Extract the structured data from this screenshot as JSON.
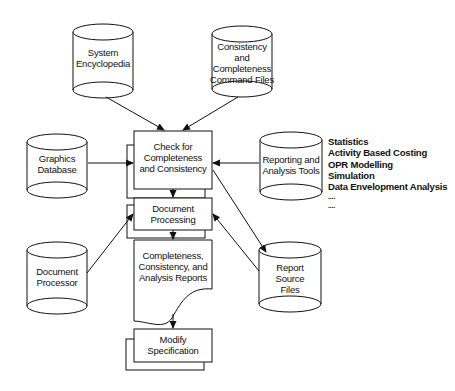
{
  "diagram": {
    "type": "flowchart",
    "nodes": {
      "system_encyclopedia": {
        "shape": "database",
        "label": "System Encyclopedia",
        "lines": [
          "System",
          "Encyclopedia"
        ]
      },
      "command_files": {
        "shape": "database",
        "label": "Consistency and Completeness Command Files",
        "lines": [
          "Consistency",
          "and",
          "Completeness",
          "Command Files"
        ]
      },
      "graphics_database": {
        "shape": "database",
        "label": "Graphics Database",
        "lines": [
          "Graphics",
          "Database"
        ]
      },
      "check": {
        "shape": "process-stack",
        "label": "Check for Completeness and Consistency",
        "lines": [
          "Check for",
          "Completeness",
          "and Consistency"
        ]
      },
      "reporting_tools": {
        "shape": "database",
        "label": "Reporting and Analysis Tools",
        "lines": [
          "Reporting and",
          "Analysis Tools"
        ]
      },
      "document_processing": {
        "shape": "process-stack",
        "label": "Document Processing",
        "lines": [
          "Document",
          "Processing"
        ]
      },
      "document_processor": {
        "shape": "database",
        "label": "Document Processor",
        "lines": [
          "Document",
          "Processor"
        ]
      },
      "reports": {
        "shape": "document",
        "label": "Completeness, Consistency, and Analysis Reports",
        "lines": [
          "Completeness,",
          "Consistency, and",
          "Analysis Reports"
        ]
      },
      "report_source_files": {
        "shape": "database",
        "label": "Report Source Files",
        "lines": [
          "Report",
          "Source",
          "Files"
        ]
      },
      "modify_specification": {
        "shape": "process-stack",
        "label": "Modify Specification",
        "lines": [
          "Modify",
          "Specification"
        ]
      }
    },
    "tool_list": [
      "Statistics",
      "Activity Based Costing",
      "OPR Modelling",
      "Simulation",
      "Data Envelopment Analysis",
      "....",
      "...."
    ],
    "edges": [
      {
        "from": "system_encyclopedia",
        "to": "check"
      },
      {
        "from": "command_files",
        "to": "check"
      },
      {
        "from": "graphics_database",
        "to": "check"
      },
      {
        "from": "reporting_tools",
        "to": "check"
      },
      {
        "from": "check",
        "to": "document_processing"
      },
      {
        "from": "check",
        "to": "report_source_files"
      },
      {
        "from": "document_processor",
        "to": "document_processing"
      },
      {
        "from": "report_source_files",
        "to": "document_processing"
      },
      {
        "from": "document_processing",
        "to": "reports"
      },
      {
        "from": "reports",
        "to": "modify_specification"
      }
    ]
  }
}
